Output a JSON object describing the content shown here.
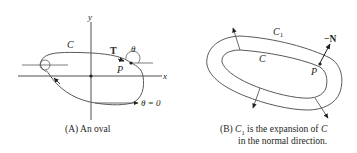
{
  "panel_a": {
    "labels": {
      "y_axis": "y",
      "x_axis": "x",
      "curve": "C",
      "tangent": "T",
      "angle": "θ",
      "point": "P",
      "theta_zero": "θ = 0"
    },
    "caption": "(A) An oval"
  },
  "panel_b": {
    "labels": {
      "outer_curve": "C",
      "outer_curve_sub": "1",
      "inner_curve": "C",
      "normal": "−N",
      "point": "P"
    },
    "caption_line1_prefix": "(B) ",
    "caption_c": "C",
    "caption_sub": "1",
    "caption_line1_mid": " is the expansion of ",
    "caption_c2": "C",
    "caption_line2": "in the normal direction."
  },
  "colors": {
    "ink": "#231f20",
    "curve": "#5a5a5a"
  }
}
